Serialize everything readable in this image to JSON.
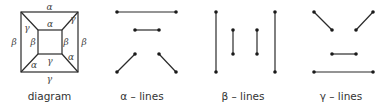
{
  "captions": {
    "diagram": "diagram",
    "alpha": "α – lines",
    "beta": "β – lines",
    "gamma": "γ – lines"
  },
  "diagram_labels": {
    "outer_top": "α",
    "outer_bottom": "γ",
    "outer_left": "β",
    "outer_right": "β",
    "inner_top": "α",
    "inner_bottom": "γ",
    "inner_left": "β",
    "inner_right": "β",
    "diag_top_left": "γ",
    "diag_top_right": "γ",
    "diag_bottom_left": "α",
    "diag_bottom_right": "α"
  }
}
